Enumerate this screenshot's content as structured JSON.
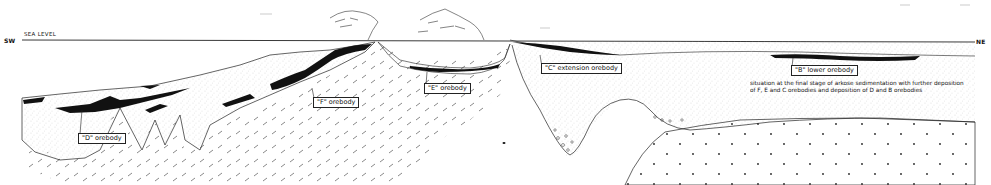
{
  "diagram": {
    "type": "geological cross-section",
    "orientation": {
      "left": "SW",
      "right": "NE"
    },
    "reference_line": "SEA LEVEL",
    "labels": {
      "d_orebody": "\"D\" orebody",
      "f_orebody": "\"F\" orebody",
      "e_orebody": "\"E\" orebody",
      "c_extension_orebody": "\"C\" extension orebody",
      "b_lower_orebody": "\"B\" lower orebody"
    },
    "caption": "situation at the final stage of arkose sedimentation with further deposition of F, E and C orebodies and deposition of D and B orebodies",
    "colors": {
      "ink": "#111111",
      "background": "#ffffff",
      "stipple": "#888888"
    }
  }
}
